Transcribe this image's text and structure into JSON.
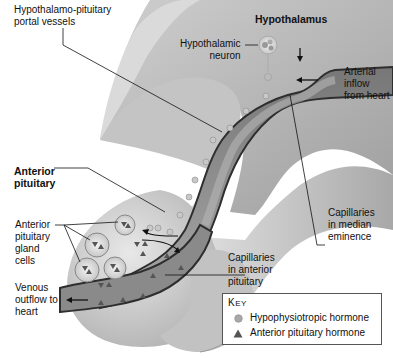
{
  "labels": {
    "portal_vessels": [
      "Hypothalamo-pituitary",
      "portal vessels"
    ],
    "hypothalamus": "Hypothalamus",
    "hypothalamic_neuron": [
      "Hypothalamic",
      "neuron"
    ],
    "arterial_inflow": [
      "Arterial",
      "inflow",
      "from heart"
    ],
    "anterior_pituitary": [
      "Anterior",
      "pituitary"
    ],
    "capillaries_median": [
      "Capillaries",
      "in median",
      "eminence"
    ],
    "gland_cells": [
      "Anterior",
      "pituitary",
      "gland",
      "cells"
    ],
    "capillaries_anterior": [
      "Capillaries",
      "in anterior",
      "pituitary"
    ],
    "venous_outflow": [
      "Venous",
      "outflow to",
      "heart"
    ]
  },
  "key": {
    "title_first": "K",
    "title_rest": "EY",
    "items": [
      {
        "symbol": "circle",
        "label": "Hypophysiotropic hormone",
        "color": "#a8a8a8"
      },
      {
        "symbol": "triangle",
        "label": "Anterior pituitary hormone",
        "color": "#555555"
      }
    ]
  },
  "colors": {
    "tissue_light": "#d9d9d9",
    "tissue_mid": "#b8b8b8",
    "tissue_dark": "#8c8c8c",
    "vessel_wall": "#3a3a3a",
    "vessel_fill": "#9a9a9a"
  }
}
